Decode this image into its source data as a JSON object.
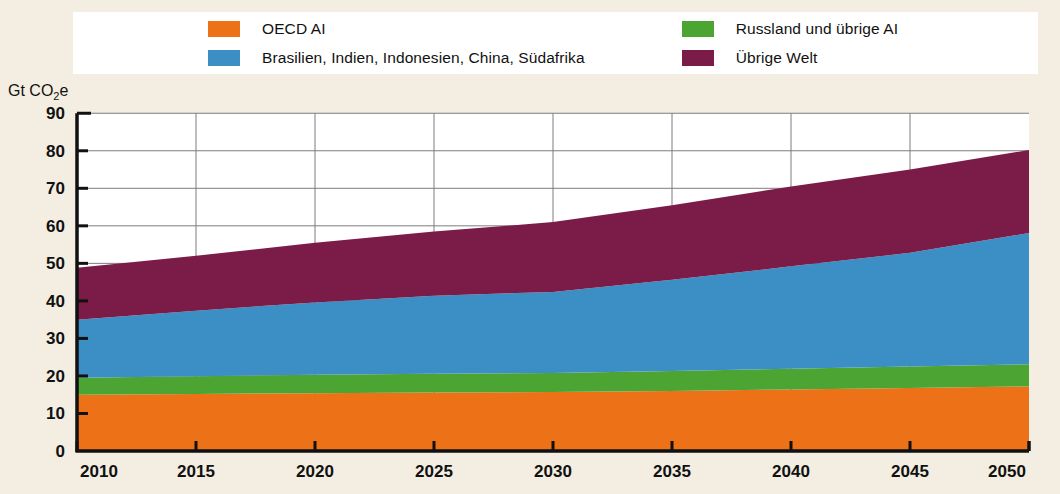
{
  "legend": {
    "columns": [
      {
        "items": [
          {
            "label": "OECD AI",
            "color": "#ec7117",
            "swatch_name": "legend-swatch-oecd"
          },
          {
            "label": "Brasilien, Indien, Indonesien, China, Südafrika",
            "color": "#3b8fc4",
            "swatch_name": "legend-swatch-bricss"
          }
        ]
      },
      {
        "items": [
          {
            "label": "Russland und übrige AI",
            "color": "#4ca533",
            "swatch_name": "legend-swatch-russia"
          },
          {
            "label": "Übrige Welt",
            "color": "#7b1c48",
            "swatch_name": "legend-swatch-rest"
          }
        ]
      }
    ]
  },
  "axis": {
    "y_label_prefix": "Gt CO",
    "y_label_sub": "2",
    "y_label_suffix": "e",
    "y_ticks": [
      "0",
      "10",
      "20",
      "30",
      "40",
      "50",
      "60",
      "70",
      "80",
      "90"
    ],
    "x_ticks": [
      "2010",
      "2015",
      "2020",
      "2025",
      "2030",
      "2035",
      "2040",
      "2045",
      "2050"
    ]
  },
  "chart_data": {
    "type": "area",
    "title": "",
    "xlabel": "",
    "ylabel": "Gt CO2e",
    "stacked": true,
    "grid": true,
    "legend_position": "top",
    "xlim": [
      2010,
      2050
    ],
    "ylim": [
      0,
      90
    ],
    "x": [
      2010,
      2015,
      2020,
      2025,
      2030,
      2035,
      2040,
      2045,
      2050
    ],
    "series": [
      {
        "name": "OECD AI",
        "color": "#ec7117",
        "values": [
          15.0,
          15.2,
          15.4,
          15.6,
          15.7,
          16.0,
          16.4,
          16.8,
          17.2
        ]
      },
      {
        "name": "Russland und übrige AI",
        "color": "#4ca533",
        "values": [
          4.5,
          4.7,
          4.9,
          5.0,
          5.1,
          5.3,
          5.5,
          5.7,
          5.9
        ]
      },
      {
        "name": "Brasilien, Indien, Indonesien, China, Südafrika",
        "color": "#3b8fc4",
        "values": [
          15.5,
          17.5,
          19.3,
          20.8,
          21.6,
          24.3,
          27.3,
          30.3,
          35.0
        ]
      },
      {
        "name": "Übrige Welt",
        "color": "#7b1c48",
        "values": [
          13.8,
          14.6,
          15.9,
          17.1,
          18.6,
          19.9,
          21.3,
          22.2,
          22.1
        ]
      }
    ],
    "totals": [
      48.8,
      52.0,
      55.5,
      58.5,
      61.0,
      65.5,
      70.5,
      75.0,
      80.2
    ]
  }
}
